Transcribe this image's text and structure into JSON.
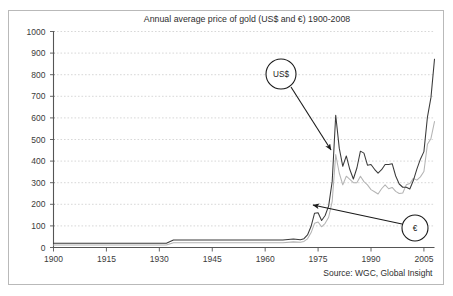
{
  "panel": {
    "border_color": "#b9b9b9",
    "background": "#ffffff"
  },
  "chart_data": {
    "type": "line",
    "title": "Annual average price of gold (US$ and €) 1900-2008",
    "xlabel": "",
    "ylabel": "",
    "xlim": [
      1900,
      2008
    ],
    "ylim": [
      0,
      1000
    ],
    "grid": true,
    "grid_axis": "y",
    "legend_position": "annotation-callouts",
    "y_ticks": [
      0,
      100,
      200,
      300,
      400,
      500,
      600,
      700,
      800,
      900,
      1000
    ],
    "y_tick_labels": [
      "0",
      "100",
      "200",
      "300",
      "400",
      "500",
      "600",
      "700",
      "800",
      "900",
      "1000"
    ],
    "x_ticks": [
      1900,
      1915,
      1930,
      1945,
      1960,
      1975,
      1990,
      2005
    ],
    "x_tick_labels": [
      "1900",
      "1915",
      "1930",
      "1945",
      "1960",
      "1975",
      "1990",
      "2005"
    ],
    "source": "Source: WGC, Global Insight",
    "series": [
      {
        "name": "US$",
        "color": "#3a3a3a",
        "x": [
          1900,
          1905,
          1910,
          1915,
          1920,
          1925,
          1930,
          1932,
          1934,
          1935,
          1940,
          1945,
          1950,
          1955,
          1960,
          1965,
          1968,
          1970,
          1971,
          1972,
          1973,
          1974,
          1975,
          1976,
          1977,
          1978,
          1979,
          1980,
          1981,
          1982,
          1983,
          1984,
          1985,
          1986,
          1987,
          1988,
          1989,
          1990,
          1991,
          1992,
          1993,
          1994,
          1995,
          1996,
          1997,
          1998,
          1999,
          2000,
          2001,
          2002,
          2003,
          2004,
          2005,
          2006,
          2007,
          2008
        ],
        "values": [
          20,
          20,
          20,
          20,
          20,
          20,
          20,
          20,
          35,
          35,
          35,
          35,
          35,
          35,
          35,
          35,
          39,
          36,
          41,
          58,
          97,
          159,
          161,
          125,
          148,
          193,
          306,
          612,
          460,
          376,
          424,
          361,
          317,
          368,
          446,
          437,
          381,
          384,
          362,
          344,
          360,
          384,
          384,
          388,
          331,
          294,
          279,
          279,
          271,
          310,
          363,
          409,
          444,
          604,
          695,
          872
        ]
      },
      {
        "name": "€",
        "color": "#b4b4b4",
        "x": [
          1900,
          1905,
          1910,
          1915,
          1920,
          1925,
          1930,
          1932,
          1934,
          1935,
          1940,
          1945,
          1950,
          1955,
          1960,
          1965,
          1968,
          1970,
          1971,
          1972,
          1973,
          1974,
          1975,
          1976,
          1977,
          1978,
          1979,
          1980,
          1981,
          1982,
          1983,
          1984,
          1985,
          1986,
          1987,
          1988,
          1989,
          1990,
          1991,
          1992,
          1993,
          1994,
          1995,
          1996,
          1997,
          1998,
          1999,
          2000,
          2001,
          2002,
          2003,
          2004,
          2005,
          2006,
          2007,
          2008
        ],
        "values": [
          12,
          12,
          12,
          12,
          12,
          12,
          12,
          12,
          22,
          22,
          22,
          22,
          22,
          22,
          22,
          22,
          26,
          24,
          28,
          40,
          68,
          112,
          118,
          96,
          112,
          140,
          214,
          430,
          345,
          290,
          330,
          315,
          300,
          300,
          330,
          305,
          290,
          268,
          258,
          248,
          272,
          290,
          272,
          278,
          260,
          250,
          252,
          290,
          296,
          320,
          312,
          327,
          352,
          478,
          505,
          583
        ]
      }
    ],
    "annotations": [
      {
        "label": "US$",
        "marker": "circled-label",
        "circle_cx": 281,
        "circle_cy": 74,
        "circle_r": 15,
        "arrow_x1": 291,
        "arrow_y1": 87,
        "arrow_x2": 331,
        "arrow_y2": 150
      },
      {
        "label": "€",
        "marker": "circled-label",
        "circle_cx": 415,
        "circle_cy": 228,
        "circle_r": 13,
        "arrow_x1": 402,
        "arrow_y1": 224,
        "arrow_x2": 313,
        "arrow_y2": 205
      }
    ]
  }
}
